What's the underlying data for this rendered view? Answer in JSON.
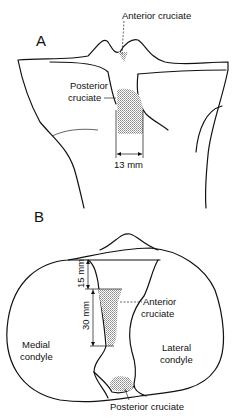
{
  "panels": {
    "a": {
      "letter": "A",
      "labels": {
        "anterior": "Anterior cruciate",
        "posterior_line1": "Posterior",
        "posterior_line2": "cruciate",
        "width": "13 mm"
      }
    },
    "b": {
      "letter": "B",
      "labels": {
        "dim_top": "15 mm",
        "dim_mid": "30 mm",
        "anterior_line1": "Anterior",
        "anterior_line2": "cruciate",
        "medial_line1": "Medial",
        "medial_line2": "condyle",
        "lateral_line1": "Lateral",
        "lateral_line2": "condyle",
        "posterior": "Posterior cruciate"
      }
    }
  },
  "colors": {
    "ink": "#111111",
    "hatch": "#9a9a9a"
  }
}
